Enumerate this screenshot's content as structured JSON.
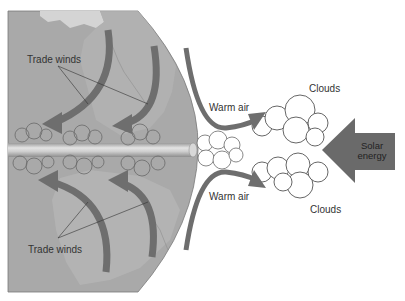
{
  "diagram": {
    "labels": {
      "trade_winds_top": "Trade winds",
      "trade_winds_bottom": "Trade winds",
      "warm_air_top": "Warm air",
      "warm_air_bottom": "Warm air",
      "clouds_top": "Clouds",
      "clouds_bottom": "Clouds",
      "solar_line1": "Solar",
      "solar_line2": "energy"
    },
    "colors": {
      "globe": "#a9a9a9",
      "land": "#b8b8b8",
      "land_light": "#d4d4d4",
      "arrow": "#6e6e6e",
      "solar_arrow": "#6a6a6a",
      "cloud_stroke": "#555555",
      "equator_band": "#c8c8c8"
    }
  }
}
